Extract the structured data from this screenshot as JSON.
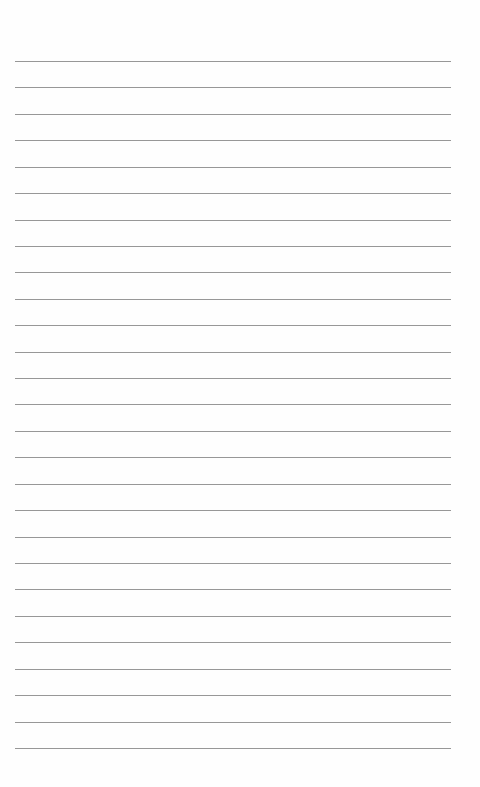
{
  "page": {
    "type": "lined-paper",
    "line_count": 27,
    "first_line_y": 61,
    "line_spacing": 26.42,
    "line_left": 15,
    "line_width": 436,
    "line_color": "#8c8c8c",
    "background_color": "#fefefe"
  }
}
